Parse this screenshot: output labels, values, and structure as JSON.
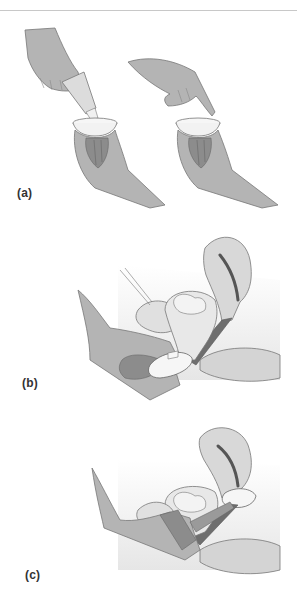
{
  "figure": {
    "panels": [
      {
        "id": "a",
        "label": "(a)",
        "description": "Spermicide squeezed from tube into diaphragm held in one hand; then finger spreading spermicide around rim"
      },
      {
        "id": "b",
        "label": "(b)",
        "description": "Diaphragm folded and inserted into vagina, sagittal section of pelvis"
      },
      {
        "id": "c",
        "label": "(c)",
        "description": "Diaphragm in place covering the cervix, finger checking position"
      }
    ],
    "colors": {
      "skin": "#b4b4b4",
      "skin_dark": "#8c8c8c",
      "skin_outline": "#777777",
      "tissue_light": "#e0e0e0",
      "tissue_mid": "#cfcfcf",
      "canal_dark": "#6e6e6e",
      "device": "#f6f6f6",
      "background_shade": "#ececec",
      "rule": "#c8c8c8"
    }
  }
}
